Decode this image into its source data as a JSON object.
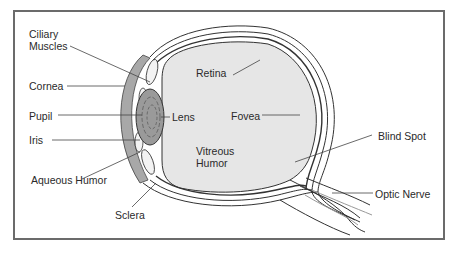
{
  "diagram": {
    "type": "anatomy",
    "labels": {
      "ciliary_muscles_1": "Ciliary",
      "ciliary_muscles_2": "Muscles",
      "cornea": "Cornea",
      "pupil": "Pupil",
      "iris": "Iris",
      "aqueous_humor": "Aqueous Humor",
      "sclera": "Sclera",
      "retina": "Retina",
      "lens": "Lens",
      "fovea": "Fovea",
      "vitreous_humor_1": "Vitreous",
      "vitreous_humor_2": "Humor",
      "blind_spot": "Blind Spot",
      "optic_nerve": "Optic Nerve"
    },
    "colors": {
      "frame": "#6b6b6b",
      "vitreous_fill": "#e6e6e6",
      "cornea_fill": "#a8a8a8",
      "lens_fill": "#9a9a9a",
      "line": "#333333"
    }
  }
}
